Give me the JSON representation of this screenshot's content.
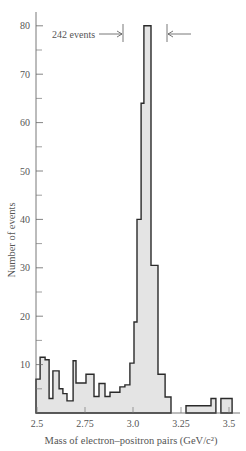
{
  "chart_data": {
    "type": "bar",
    "subtype": "histogram",
    "title": "",
    "xlabel": "Mass of electron–positron pairs (GeV/c²)",
    "ylabel": "Number of events",
    "xlim": [
      2.495,
      3.55
    ],
    "ylim": [
      0,
      82
    ],
    "x_ticks": [
      2.5,
      2.75,
      3.0,
      3.25,
      3.5
    ],
    "x_tick_labels": [
      "2.5",
      "2.75",
      "3.0",
      "3.25",
      "3.5"
    ],
    "y_ticks_major": [
      10,
      20,
      30,
      40,
      50,
      60,
      70,
      80
    ],
    "y_tick_labels": [
      "10",
      "20",
      "30",
      "40",
      "50",
      "60",
      "70",
      "80"
    ],
    "y_ticks_minor": [
      5,
      15,
      25,
      35,
      45,
      55,
      65,
      75
    ],
    "grid": false,
    "legend": null,
    "fill_color": "#e4e4e4",
    "line_color": "#2a2a2a",
    "bins": [
      {
        "x0": 2.495,
        "x1": 2.516,
        "count": 7
      },
      {
        "x0": 2.516,
        "x1": 2.542,
        "count": 11.5
      },
      {
        "x0": 2.542,
        "x1": 2.563,
        "count": 11
      },
      {
        "x0": 2.563,
        "x1": 2.583,
        "count": 3
      },
      {
        "x0": 2.583,
        "x1": 2.615,
        "count": 8.7
      },
      {
        "x0": 2.615,
        "x1": 2.635,
        "count": 5
      },
      {
        "x0": 2.635,
        "x1": 2.656,
        "count": 4
      },
      {
        "x0": 2.656,
        "x1": 2.688,
        "count": 2.5
      },
      {
        "x0": 2.688,
        "x1": 2.703,
        "count": 10.8
      },
      {
        "x0": 2.703,
        "x1": 2.755,
        "count": 6.2
      },
      {
        "x0": 2.755,
        "x1": 2.797,
        "count": 8
      },
      {
        "x0": 2.797,
        "x1": 2.823,
        "count": 3.4
      },
      {
        "x0": 2.823,
        "x1": 2.854,
        "count": 6.1
      },
      {
        "x0": 2.854,
        "x1": 2.88,
        "count": 3.4
      },
      {
        "x0": 2.88,
        "x1": 2.932,
        "count": 4.3
      },
      {
        "x0": 2.932,
        "x1": 2.958,
        "count": 5.4
      },
      {
        "x0": 2.958,
        "x1": 2.984,
        "count": 5.8
      },
      {
        "x0": 2.984,
        "x1": 3.005,
        "count": 10.3
      },
      {
        "x0": 3.005,
        "x1": 3.021,
        "count": 18.8
      },
      {
        "x0": 3.021,
        "x1": 3.042,
        "count": 40
      },
      {
        "x0": 3.042,
        "x1": 3.057,
        "count": 64
      },
      {
        "x0": 3.057,
        "x1": 3.094,
        "count": 80
      },
      {
        "x0": 3.094,
        "x1": 3.13,
        "count": 30.5
      },
      {
        "x0": 3.13,
        "x1": 3.167,
        "count": 8
      },
      {
        "x0": 3.167,
        "x1": 3.198,
        "count": 3.3
      },
      {
        "x0": 3.276,
        "x1": 3.406,
        "count": 1.5
      },
      {
        "x0": 3.406,
        "x1": 3.432,
        "count": 3
      },
      {
        "x0": 3.458,
        "x1": 3.516,
        "count": 3
      }
    ],
    "annotations": [
      {
        "text": "242 events",
        "type": "range-bracket",
        "x_start": 2.935,
        "x_end": 3.165,
        "y": 78
      }
    ]
  }
}
